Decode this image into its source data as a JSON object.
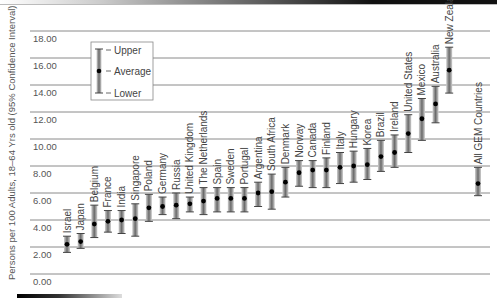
{
  "chart_data": {
    "type": "errorbar",
    "title": "",
    "xlabel": "",
    "ylabel": "Persons per 100 Adults, 18–64 Yrs old (95% Confidence Interval)",
    "ylim": [
      0,
      18
    ],
    "yticks": [
      "0.00",
      "2.00",
      "4.00",
      "6.00",
      "8.00",
      "10.00",
      "12.00",
      "14.00",
      "16.00",
      "18.00"
    ],
    "grid": true,
    "legend": {
      "position": "upper-left",
      "entries": [
        "Upper",
        "Average",
        "Lower"
      ]
    },
    "categories": [
      "Israel",
      "Japan",
      "Belgium",
      "France",
      "India",
      "Singapore",
      "Poland",
      "Germany",
      "Russia",
      "United Kingdom",
      "The Netherlands",
      "Spain",
      "Sweden",
      "Portugal",
      "Argentina",
      "South Africa",
      "Denmark",
      "Norway",
      "Canada",
      "Finland",
      "Italy",
      "Hungary",
      "Korea",
      "Brazil",
      "Ireland",
      "United States",
      "Mexico",
      "Australia",
      "New Zealand",
      "All GEM Countries"
    ],
    "series": [
      {
        "name": "Average",
        "values": [
          2.2,
          2.4,
          3.7,
          3.9,
          4.0,
          4.1,
          4.9,
          5.0,
          5.1,
          5.2,
          5.4,
          5.6,
          5.6,
          5.6,
          6.0,
          6.1,
          6.8,
          7.5,
          7.7,
          7.7,
          7.9,
          8.0,
          8.1,
          8.7,
          9.0,
          10.4,
          11.5,
          12.6,
          15.1,
          6.7
        ]
      },
      {
        "name": "Upper",
        "values": [
          2.8,
          3.0,
          5.1,
          4.7,
          4.7,
          5.2,
          5.9,
          5.7,
          6.0,
          5.7,
          6.4,
          6.4,
          6.4,
          6.4,
          6.8,
          7.4,
          7.9,
          8.4,
          8.4,
          8.6,
          9.0,
          9.1,
          9.3,
          9.9,
          10.3,
          11.8,
          13.0,
          13.9,
          16.8,
          7.9
        ]
      },
      {
        "name": "Lower",
        "values": [
          1.6,
          1.9,
          2.7,
          3.1,
          3.0,
          2.8,
          3.9,
          4.4,
          4.1,
          4.6,
          4.4,
          4.6,
          4.6,
          4.6,
          5.0,
          4.8,
          5.7,
          6.5,
          6.4,
          6.4,
          6.7,
          6.8,
          7.0,
          7.6,
          7.9,
          9.0,
          9.9,
          11.2,
          13.4,
          5.8
        ]
      }
    ]
  },
  "colors": {
    "grid": "#8a8a8a",
    "bar_dark": "#555555",
    "bar_light": "#d8d8d8",
    "dot": "#000000",
    "text": "#444444"
  }
}
